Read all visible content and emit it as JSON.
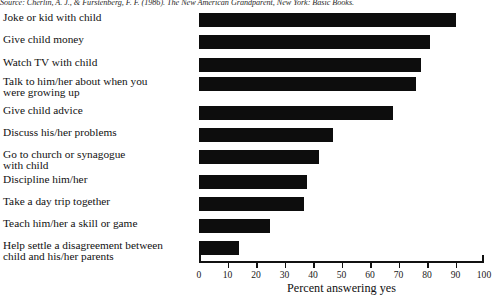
{
  "source": {
    "text": "Source: Cherlin, A. J., & Furstenberg, F. F. (1986). The New American Grandparent, New York: Basic Books."
  },
  "chart_data": {
    "type": "bar",
    "orientation": "horizontal",
    "title": "",
    "xlabel": "Percent answering yes",
    "ylabel": "",
    "xlim": [
      0,
      100
    ],
    "grid": false,
    "legend": null,
    "bar_color": "#0d0d0d",
    "xticks": [
      "0",
      "10",
      "20",
      "30",
      "40",
      "50",
      "60",
      "70",
      "80",
      "90",
      "100"
    ],
    "xtick_values": [
      0,
      10,
      20,
      30,
      40,
      50,
      60,
      70,
      80,
      90,
      100
    ],
    "categories": [
      "Joke or kid with child",
      "Give child money",
      "Watch TV with child",
      "Talk to him/her about when you\nwere growing up",
      "Give child advice",
      "Discuss his/her problems",
      "Go to church or synagogue\nwith child",
      "Discipline him/her",
      "Take a day trip together",
      "Teach him/her a skill or game",
      "Help settle a disagreement between\nchild and his/her parents"
    ],
    "values": [
      90,
      81,
      78,
      76,
      68,
      47,
      42,
      38,
      37,
      25,
      14
    ]
  }
}
